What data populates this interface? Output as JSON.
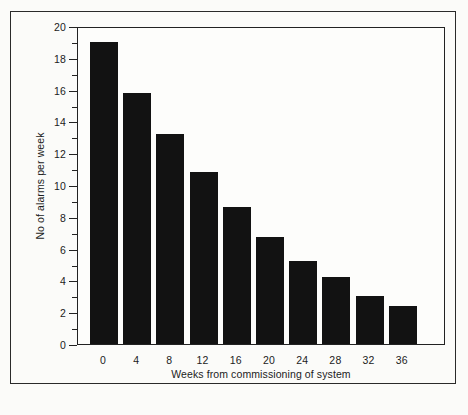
{
  "chart_data": {
    "type": "bar",
    "title": "",
    "subtitle": "",
    "xlabel": "Weeks from commissioning of system",
    "ylabel": "No of alarms per week",
    "categories": [
      "0",
      "4",
      "8",
      "12",
      "16",
      "20",
      "24",
      "28",
      "32",
      "36"
    ],
    "values": [
      19.0,
      15.8,
      13.2,
      10.8,
      8.6,
      6.7,
      5.2,
      4.2,
      3.0,
      2.4
    ],
    "series": [
      {
        "name": "No of alarms per week",
        "values": [
          19.0,
          15.8,
          13.2,
          10.8,
          8.6,
          6.7,
          5.2,
          4.2,
          3.0,
          2.4
        ],
        "color": "#121212"
      }
    ],
    "ylim": [
      0,
      20
    ],
    "xlim": [
      -2,
      38
    ],
    "y_major_ticks": [
      0,
      2,
      4,
      6,
      8,
      10,
      12,
      14,
      16,
      18,
      20
    ],
    "y_minor_ticks": [
      1,
      3,
      5,
      7,
      9,
      11,
      13,
      15,
      17,
      19
    ],
    "y_tick_labels": [
      "0",
      "2",
      "4",
      "6",
      "8",
      "10",
      "12",
      "14",
      "16",
      "18",
      "20"
    ],
    "x_tick_labels": [
      "0",
      "4",
      "8",
      "12",
      "16",
      "20",
      "24",
      "28",
      "32",
      "36"
    ],
    "grid": false,
    "legend": false,
    "legend_position": "none",
    "bar_color": "#121212",
    "axis_color": "#222222",
    "background_color": "#fbfbf9",
    "annotations": []
  },
  "figure": {
    "frame_visible": true,
    "plot_border_visible": true
  }
}
